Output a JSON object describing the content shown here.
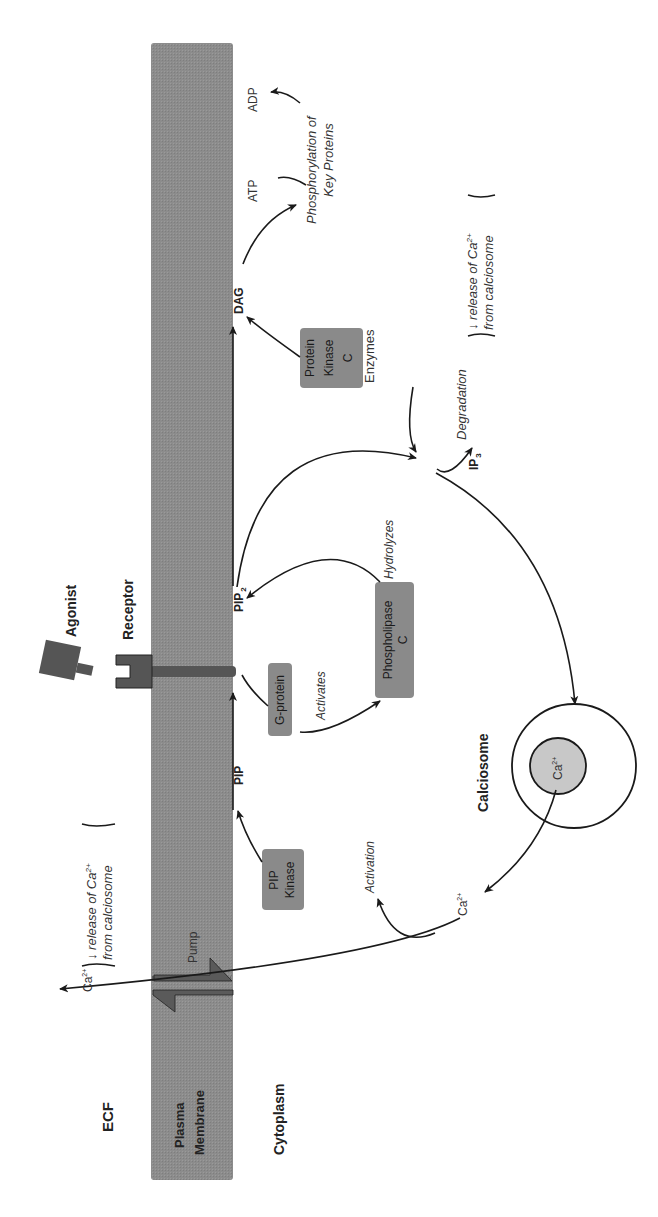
{
  "diagram": {
    "orientation": "rotated 90° counter-clockwise (text reads bottom-to-top)",
    "regions": {
      "ecf": "ECF",
      "membrane_line1": "Plasma",
      "membrane_line2": "Membrane",
      "cytoplasm": "Cytoplasm"
    },
    "molecules": {
      "agonist": "Agonist",
      "receptor": "Receptor",
      "pip": "PIP",
      "pip2": "PIP",
      "pip2_sub": "2",
      "dag": "DAG",
      "ip3": "IP",
      "ip3_sub": "3",
      "atp": "ATP",
      "adp": "ADP",
      "ca_in": "Ca",
      "ca_in_sup": "2+",
      "ca_out": "Ca",
      "ca_out_sup": "2+",
      "ca_store": "Ca",
      "ca_store_sup": "2+",
      "enzymes": "Enzymes",
      "pump": "Pump",
      "calciosome": "Calciosome"
    },
    "boxes": {
      "pip_kinase": [
        "PIP",
        "Kinase"
      ],
      "g_protein": [
        "G-protein"
      ],
      "phospholipase_c": [
        "Phospholipase",
        "C"
      ],
      "protein_kinase_c": [
        "Protein",
        "Kinase",
        "C"
      ]
    },
    "processes": {
      "activates": "Activates",
      "hydrolyzes": "Hydrolyzes",
      "degradation": "Degradation",
      "activation": "Activation",
      "phosphorylation_line1": "Phosphorylation of",
      "phosphorylation_line2": "Key Proteins"
    },
    "notes": {
      "release_top_line1": "↓ release of Ca",
      "release_top_sup": "2+",
      "release_top_line2": "from calciosome",
      "release_bottom_line1": "↓ release of Ca",
      "release_bottom_sup": "2+",
      "release_bottom_line2": "from calciosome"
    },
    "colors": {
      "membrane": "#8c8c8c",
      "box": "#8a8a8a",
      "receptor": "#555555",
      "pump": "#5a5a5a",
      "ca_store": "#c8c8c8",
      "line": "#1a1a1a"
    }
  }
}
